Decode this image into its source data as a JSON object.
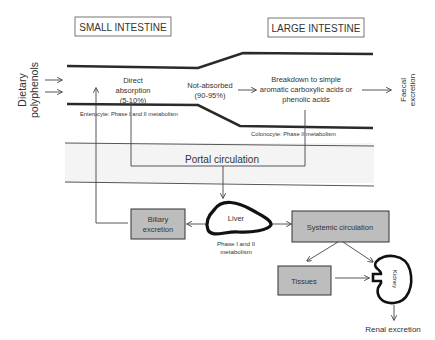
{
  "headers": {
    "small_intestine": "SMALL INTESTINE",
    "large_intestine": "LARGE INTESTINE"
  },
  "input": {
    "line1": "Dietary",
    "line2": "polyphenols"
  },
  "small_intestine": {
    "absorption_line1": "Direct",
    "absorption_line2": "absorption",
    "absorption_line3": "(5-10%)",
    "enterocyte": "Enterocyte: Phase I and II metabolism"
  },
  "transit": {
    "not_absorbed_line1": "Not-absorbed",
    "not_absorbed_line2": "(90-95%)"
  },
  "large_intestine": {
    "breakdown_line1": "Breakdown to simple",
    "breakdown_line2": "aromatic carboxylic acids or",
    "breakdown_line3": "phenolic acids",
    "colonocyte": "Colonocyte: Phase II metabolism"
  },
  "output": {
    "faecal_line1": "Faecal",
    "faecal_line2": "excretion"
  },
  "portal": {
    "label": "Portal circulation",
    "band_color": "#f4f4f4"
  },
  "liver": {
    "label": "Liver",
    "metabolism_line1": "Phase I and II",
    "metabolism_line2": "metabolism"
  },
  "boxes": {
    "biliary_line1": "Biliary",
    "biliary_line2": "excretion",
    "systemic": "Systemic circulation",
    "tissues": "Tissues",
    "fill_color": "#bdbdbd"
  },
  "kidney": {
    "label": "Kidney",
    "renal": "Renal excretion"
  }
}
